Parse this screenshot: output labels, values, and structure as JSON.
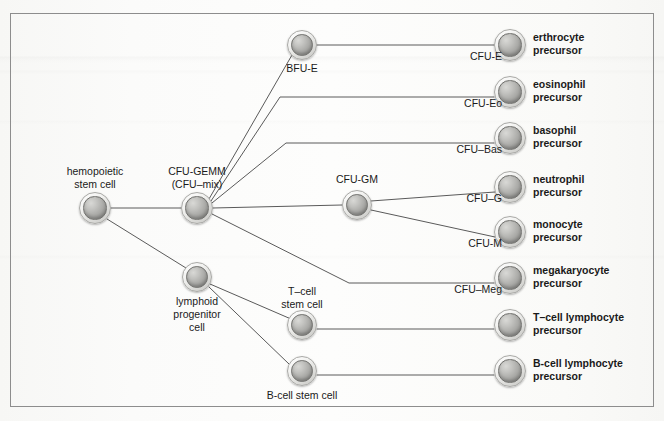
{
  "figure": {
    "background_color": "#fdfdfc",
    "frame_color": "#8d8d8d",
    "edge_color": "#5a5a5a"
  },
  "nodes": {
    "hemopoietic_stem_cell": {
      "label": "hemopoietic\nstem cell",
      "x": 95,
      "y": 208,
      "r": 16
    },
    "cfu_gemm": {
      "label": "CFU-GEMM\n(CFU–mix)",
      "x": 197,
      "y": 208,
      "r": 16
    },
    "bfu_e": {
      "label": "BFU-E",
      "x": 302,
      "y": 45,
      "r": 15
    },
    "cfu_gm": {
      "label": "CFU-GM",
      "x": 357,
      "y": 205,
      "r": 15
    },
    "lymphoid_progenitor": {
      "label": "lymphoid\nprogenitor\ncell",
      "x": 197,
      "y": 277,
      "r": 15
    },
    "t_cell_stem": {
      "label": "T–cell\nstem cell",
      "x": 302,
      "y": 325,
      "r": 15
    },
    "b_cell_stem": {
      "label": "B-cell stem cell",
      "x": 302,
      "y": 371,
      "r": 15
    },
    "cfu_e": {
      "label": "CFU-E",
      "x": 510,
      "y": 45,
      "r": 16
    },
    "cfu_eo": {
      "label": "CFU-Eo",
      "x": 510,
      "y": 92,
      "r": 16
    },
    "cfu_bas": {
      "label": "CFU–Bas",
      "x": 510,
      "y": 138,
      "r": 16
    },
    "cfu_g": {
      "label": "CFU–G",
      "x": 510,
      "y": 187,
      "r": 16
    },
    "cfu_m": {
      "label": "CFU-M",
      "x": 510,
      "y": 232,
      "r": 16
    },
    "cfu_meg": {
      "label": "CFU–Meg",
      "x": 510,
      "y": 278,
      "r": 16
    },
    "t_cell_lymphocyte": {
      "label": "",
      "x": 510,
      "y": 325,
      "r": 16
    },
    "b_cell_lymphocyte": {
      "label": "",
      "x": 510,
      "y": 371,
      "r": 16
    }
  },
  "terminal_labels": [
    {
      "name": "erthrocyte-precursor",
      "text": "erthrocyte\nprecursor",
      "x": 533,
      "y": 31
    },
    {
      "name": "eosinophil-precursor",
      "text": "eosinophil\nprecursor",
      "x": 533,
      "y": 78
    },
    {
      "name": "basophil-precursor",
      "text": "basophil\nprecursor",
      "x": 533,
      "y": 124
    },
    {
      "name": "neutrophil-precursor",
      "text": "neutrophil\nprecursor",
      "x": 533,
      "y": 173
    },
    {
      "name": "monocyte-precursor",
      "text": "monocyte\nprecursor",
      "x": 533,
      "y": 218
    },
    {
      "name": "megakaryocyte-precursor",
      "text": "megakaryocyte\nprecursor",
      "x": 533,
      "y": 264
    },
    {
      "name": "t-cell-lymphocyte-precursor",
      "text": "T–cell lymphocyte\nprecursor",
      "x": 533,
      "y": 311
    },
    {
      "name": "b-cell-lymphocyte-precursor",
      "text": "B-cell lymphocyte\nprecursor",
      "x": 533,
      "y": 357
    }
  ],
  "edges": [
    {
      "name": "hsc-to-cfu-gemm",
      "path": "M 111,208 L 181,208"
    },
    {
      "name": "hsc-to-lymphoid-progenitor",
      "path": "M 107,219 L 186,268"
    },
    {
      "name": "cfu-gemm-to-bfu-e",
      "path": "M 209,199 L 292,55"
    },
    {
      "name": "cfu-gemm-to-cfu-eo",
      "path": "M 211,201 L 280,97 L 494,97"
    },
    {
      "name": "cfu-gemm-to-cfu-bas",
      "path": "M 212,203 L 286,143 L 494,143"
    },
    {
      "name": "cfu-gemm-to-cfu-gm",
      "path": "M 213,208 L 342,205"
    },
    {
      "name": "cfu-gemm-to-cfu-meg",
      "path": "M 212,214 L 349,283 L 494,283"
    },
    {
      "name": "bfu-e-to-cfu-e",
      "path": "M 317,45 L 494,45"
    },
    {
      "name": "cfu-gm-to-cfu-g",
      "path": "M 371,201 L 495,192"
    },
    {
      "name": "cfu-gm-to-cfu-m",
      "path": "M 371,210 L 495,237"
    },
    {
      "name": "lymphoid-to-t-cell-stem",
      "path": "M 210,284 L 291,319"
    },
    {
      "name": "lymphoid-to-b-cell-stem",
      "path": "M 209,287 L 289,364"
    },
    {
      "name": "t-cell-stem-to-precursor",
      "path": "M 317,329 L 494,329"
    },
    {
      "name": "b-cell-stem-to-precursor",
      "path": "M 317,375 L 494,375"
    }
  ]
}
